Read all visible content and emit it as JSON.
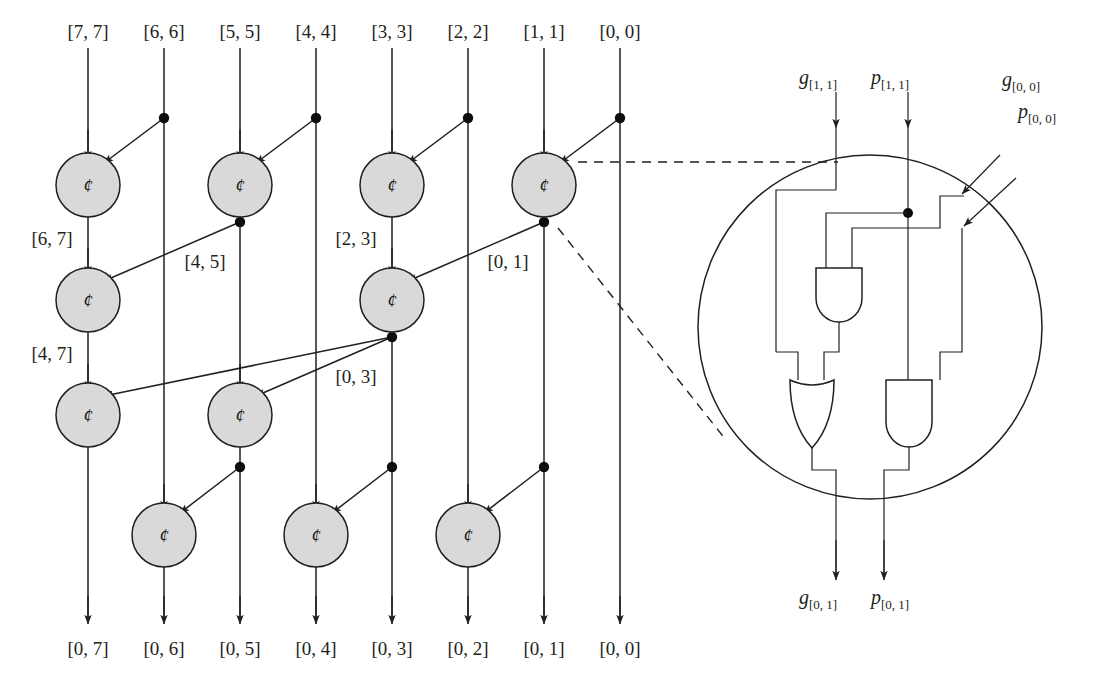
{
  "figure": {
    "operator_glyph": "¢",
    "colors": {
      "node_fill": "#d9d9d9",
      "stroke": "#231f20",
      "background": "#ffffff",
      "dot": "#0d0d0d"
    }
  },
  "top_labels": [
    {
      "text": "[7, 7]",
      "x": 88
    },
    {
      "text": "[6, 6]",
      "x": 164
    },
    {
      "text": "[5, 5]",
      "x": 240
    },
    {
      "text": "[4, 4]",
      "x": 316
    },
    {
      "text": "[3, 3]",
      "x": 392
    },
    {
      "text": "[2, 2]",
      "x": 468
    },
    {
      "text": "[1, 1]",
      "x": 544
    },
    {
      "text": "[0, 0]",
      "x": 620
    }
  ],
  "bottom_labels": [
    {
      "text": "[0, 7]",
      "x": 88
    },
    {
      "text": "[0, 6]",
      "x": 164
    },
    {
      "text": "[0, 5]",
      "x": 240
    },
    {
      "text": "[0, 4]",
      "x": 316
    },
    {
      "text": "[0, 3]",
      "x": 392
    },
    {
      "text": "[0, 2]",
      "x": 468
    },
    {
      "text": "[0, 1]",
      "x": 544
    },
    {
      "text": "[0, 0]",
      "x": 620
    }
  ],
  "edge_labels": [
    {
      "text": "[6, 7]",
      "x": 52,
      "y": 245
    },
    {
      "text": "[4, 5]",
      "x": 205,
      "y": 268
    },
    {
      "text": "[2, 3]",
      "x": 356,
      "y": 245
    },
    {
      "text": "[0, 1]",
      "x": 508,
      "y": 268
    },
    {
      "text": "[4, 7]",
      "x": 52,
      "y": 360
    },
    {
      "text": "[0, 3]",
      "x": 356,
      "y": 383
    }
  ],
  "operator_nodes": [
    {
      "col": 0,
      "row": 1,
      "cx": 88,
      "cy": 185,
      "label": "[6, 7]"
    },
    {
      "col": 2,
      "row": 1,
      "cx": 240,
      "cy": 185,
      "label": "[4, 5]"
    },
    {
      "col": 4,
      "row": 1,
      "cx": 392,
      "cy": 185,
      "label": "[2, 3]"
    },
    {
      "col": 6,
      "row": 1,
      "cx": 544,
      "cy": 185,
      "label": "[0, 1]"
    },
    {
      "col": 0,
      "row": 2,
      "cx": 88,
      "cy": 300,
      "label": "[4, 7]"
    },
    {
      "col": 4,
      "row": 2,
      "cx": 392,
      "cy": 300,
      "label": "[0, 3]"
    },
    {
      "col": 0,
      "row": 3,
      "cx": 88,
      "cy": 415,
      "label": "[0, 7]"
    },
    {
      "col": 2,
      "row": 3,
      "cx": 240,
      "cy": 415,
      "label": "[0, 5]"
    },
    {
      "col": 1,
      "row": 4,
      "cx": 164,
      "cy": 535,
      "label": "[0, 6]"
    },
    {
      "col": 3,
      "row": 4,
      "cx": 316,
      "cy": 535,
      "label": "[0, 4]"
    },
    {
      "col": 5,
      "row": 4,
      "cx": 468,
      "cy": 535,
      "label": "[0, 2]"
    }
  ],
  "detail_circuit": {
    "inputs": [
      {
        "base": "g",
        "sub": "[1, 1]",
        "x": 836,
        "y": 78
      },
      {
        "base": "p",
        "sub": "[1, 1]",
        "x": 908,
        "y": 78
      }
    ],
    "side_inputs": [
      {
        "base": "g",
        "sub": "[0, 0]",
        "x": 1000,
        "y": 80
      },
      {
        "base": "p",
        "sub": "[0, 0]",
        "x": 1016,
        "y": 112
      }
    ],
    "outputs": [
      {
        "base": "g",
        "sub": "[0, 1]",
        "x": 822,
        "y": 598
      },
      {
        "base": "p",
        "sub": "[0, 1]",
        "x": 894,
        "y": 598
      }
    ],
    "gates": [
      {
        "type": "and",
        "name": "and-gate-top",
        "x": 816,
        "y": 268
      },
      {
        "type": "or",
        "name": "or-gate-bottom",
        "x": 790,
        "y": 378
      },
      {
        "type": "and",
        "name": "and-gate-bottom",
        "x": 886,
        "y": 378
      }
    ]
  }
}
